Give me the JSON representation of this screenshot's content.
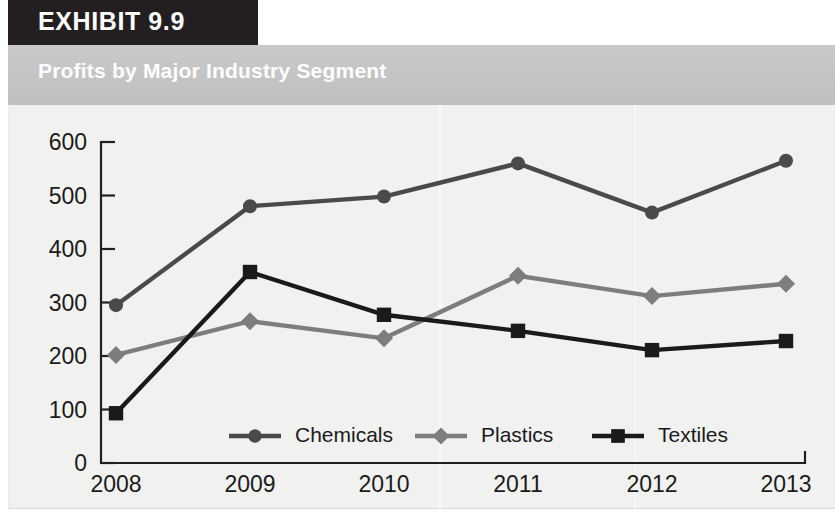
{
  "exhibit": {
    "tag_label": "EXHIBIT 9.9"
  },
  "banner": {
    "title": "Profits by Major Industry Segment"
  },
  "colors": {
    "chemicals": "#4a4a4a",
    "plastics": "#7d7d7d",
    "textiles": "#1a1a1a",
    "axis": "#231f20",
    "panel_background": "#f1f1f0",
    "banner_background": "#c4c4c4",
    "tag_background": "#231f20",
    "tag_text": "#ffffff",
    "banner_text": "#ffffff"
  },
  "chart_data": {
    "type": "line",
    "title": "Profits by Major Industry Segment",
    "xlabel": "",
    "ylabel": "",
    "categories": [
      "2008",
      "2009",
      "2010",
      "2011",
      "2012",
      "2013"
    ],
    "x": [
      2008,
      2009,
      2010,
      2011,
      2012,
      2013
    ],
    "ylim": [
      0,
      600
    ],
    "yticks": [
      0,
      100,
      200,
      300,
      400,
      500,
      600
    ],
    "ytick_labels": [
      "0",
      "100",
      "200",
      "300",
      "400",
      "500",
      "600"
    ],
    "grid": false,
    "legend_position": "inside-bottom-center",
    "series": [
      {
        "name": "Chemicals",
        "marker": "circle",
        "color": "#4a4a4a",
        "values": [
          295,
          480,
          498,
          560,
          468,
          565
        ]
      },
      {
        "name": "Plastics",
        "marker": "diamond",
        "color": "#7d7d7d",
        "values": [
          202,
          265,
          233,
          350,
          312,
          335
        ]
      },
      {
        "name": "Textiles",
        "marker": "square",
        "color": "#1a1a1a",
        "values": [
          93,
          357,
          277,
          247,
          211,
          228
        ]
      }
    ]
  }
}
